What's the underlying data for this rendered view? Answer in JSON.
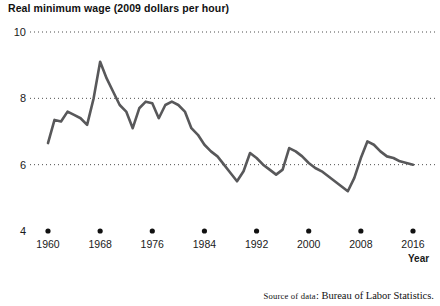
{
  "chart_data": {
    "type": "line",
    "title": "Real minimum wage (2009 dollars per hour)",
    "xlabel": "Year",
    "ylabel": "",
    "xlim": [
      1960,
      2016
    ],
    "ylim": [
      4,
      10
    ],
    "grid": true,
    "legend": null,
    "y_ticks": [
      "10",
      "8",
      "6",
      "4"
    ],
    "y_tick_values": [
      10,
      8,
      6,
      4
    ],
    "x_ticks": [
      "1960",
      "1968",
      "1976",
      "1984",
      "1992",
      "2000",
      "2008",
      "2016"
    ],
    "x_tick_values": [
      1960,
      1968,
      1976,
      1984,
      1992,
      2000,
      2008,
      2016
    ],
    "series_name": "Real minimum wage",
    "line_color": "#58585a",
    "x": [
      1960,
      1961,
      1962,
      1963,
      1964,
      1965,
      1966,
      1967,
      1968,
      1969,
      1970,
      1971,
      1972,
      1973,
      1974,
      1975,
      1976,
      1977,
      1978,
      1979,
      1980,
      1981,
      1982,
      1983,
      1984,
      1985,
      1986,
      1987,
      1988,
      1989,
      1990,
      1991,
      1992,
      1993,
      1994,
      1995,
      1996,
      1997,
      1998,
      1999,
      2000,
      2001,
      2002,
      2003,
      2004,
      2005,
      2006,
      2007,
      2008,
      2009,
      2010,
      2011,
      2012,
      2013,
      2014,
      2015,
      2016
    ],
    "values": [
      6.65,
      7.35,
      7.3,
      7.6,
      7.5,
      7.4,
      7.2,
      8.0,
      9.1,
      8.6,
      8.2,
      7.8,
      7.6,
      7.1,
      7.7,
      7.9,
      7.85,
      7.4,
      7.8,
      7.9,
      7.8,
      7.6,
      7.1,
      6.9,
      6.6,
      6.4,
      6.25,
      6.0,
      5.75,
      5.5,
      5.8,
      6.35,
      6.2,
      6.0,
      5.85,
      5.7,
      5.85,
      6.5,
      6.4,
      6.25,
      6.05,
      5.9,
      5.8,
      5.65,
      5.5,
      5.35,
      5.2,
      5.6,
      6.2,
      6.7,
      6.6,
      6.4,
      6.25,
      6.2,
      6.1,
      6.05,
      6.0
    ],
    "source_note_label": "Source of data",
    "source_note_value": "Bureau of Labor Statistics."
  }
}
